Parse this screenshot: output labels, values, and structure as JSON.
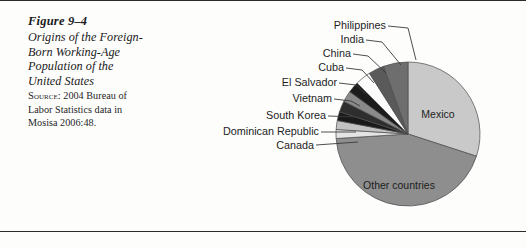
{
  "figure": {
    "number": "Figure 9–4",
    "title_lines": [
      "Origins of the Foreign-",
      "Born Working-Age",
      "Population of the",
      "United States"
    ],
    "source_prefix": "Source:",
    "source_text": "2004 Bureau of Labor Statistics data in Mosisa 2006:48.",
    "source_lines": [
      "2004 Bureau of",
      "Labor Statistics data in",
      "Mosisa 2006:48."
    ]
  },
  "chart_data": {
    "type": "pie",
    "legend": "none",
    "labels_inside": [
      "Mexico",
      "Other countries"
    ],
    "labels_callout": [
      "Canada",
      "Dominican Republic",
      "South Korea",
      "Vietnam",
      "El Salvador",
      "Cuba",
      "China",
      "India",
      "Philippines"
    ],
    "categories": [
      "Mexico",
      "Other countries",
      "Canada",
      "Dominican Republic",
      "South Korea",
      "Vietnam",
      "El Salvador",
      "Cuba",
      "China",
      "India",
      "Philippines"
    ],
    "values": [
      30.0,
      44.0,
      2.0,
      2.0,
      2.0,
      2.5,
      2.5,
      2.5,
      3.5,
      3.5,
      5.5
    ],
    "units": "percent",
    "colors": [
      "#c9c9c9",
      "#8e8e8e",
      "#e4e4e4",
      "#c2c2c2",
      "#1a1a1a",
      "#2e2e2e",
      "#8a8a8a",
      "#1c1c1c",
      "#fbfbfb",
      "#5a5a5a",
      "#6e6e6e"
    ],
    "start_angle_deg": 0,
    "direction": "clockwise"
  },
  "labels": {
    "mexico": "Mexico",
    "other_countries": "Other countries",
    "philippines": "Philippines",
    "india": "India",
    "china": "China",
    "cuba": "Cuba",
    "el_salvador": "El Salvador",
    "vietnam": "Vietnam",
    "south_korea": "South Korea",
    "dominican_republic": "Dominican Republic",
    "canada": "Canada"
  }
}
